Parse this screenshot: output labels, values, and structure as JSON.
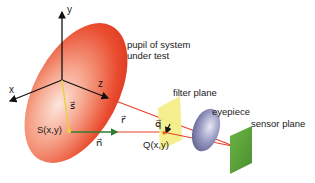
{
  "diagram": {
    "labels": {
      "pupil": [
        "pupil of system",
        "under test"
      ],
      "filter_plane": "filter plane",
      "eyepiece": "eyepiece",
      "sensor_plane": "sensor plane",
      "axis_x": "x",
      "axis_y": "y",
      "axis_z": "z",
      "vector_s": "s⃗",
      "vector_r": "r⃗",
      "vector_n": "n⃗",
      "vector_q": "q⃗",
      "point_S": "S(x,y)",
      "point_Q": "Q(x,y)"
    },
    "colors": {
      "pupil_red": "#e8402a",
      "pupil_light": "#fbd7c8",
      "filter_yellow": "#f4ee8a",
      "eyepiece_blue": "#7f82b0",
      "sensor_green": "#5ea83a",
      "ray_red": "#e8402a",
      "normal_green": "#2e7d32",
      "s_yellow": "#e8d234",
      "axis_black": "#111111"
    }
  }
}
